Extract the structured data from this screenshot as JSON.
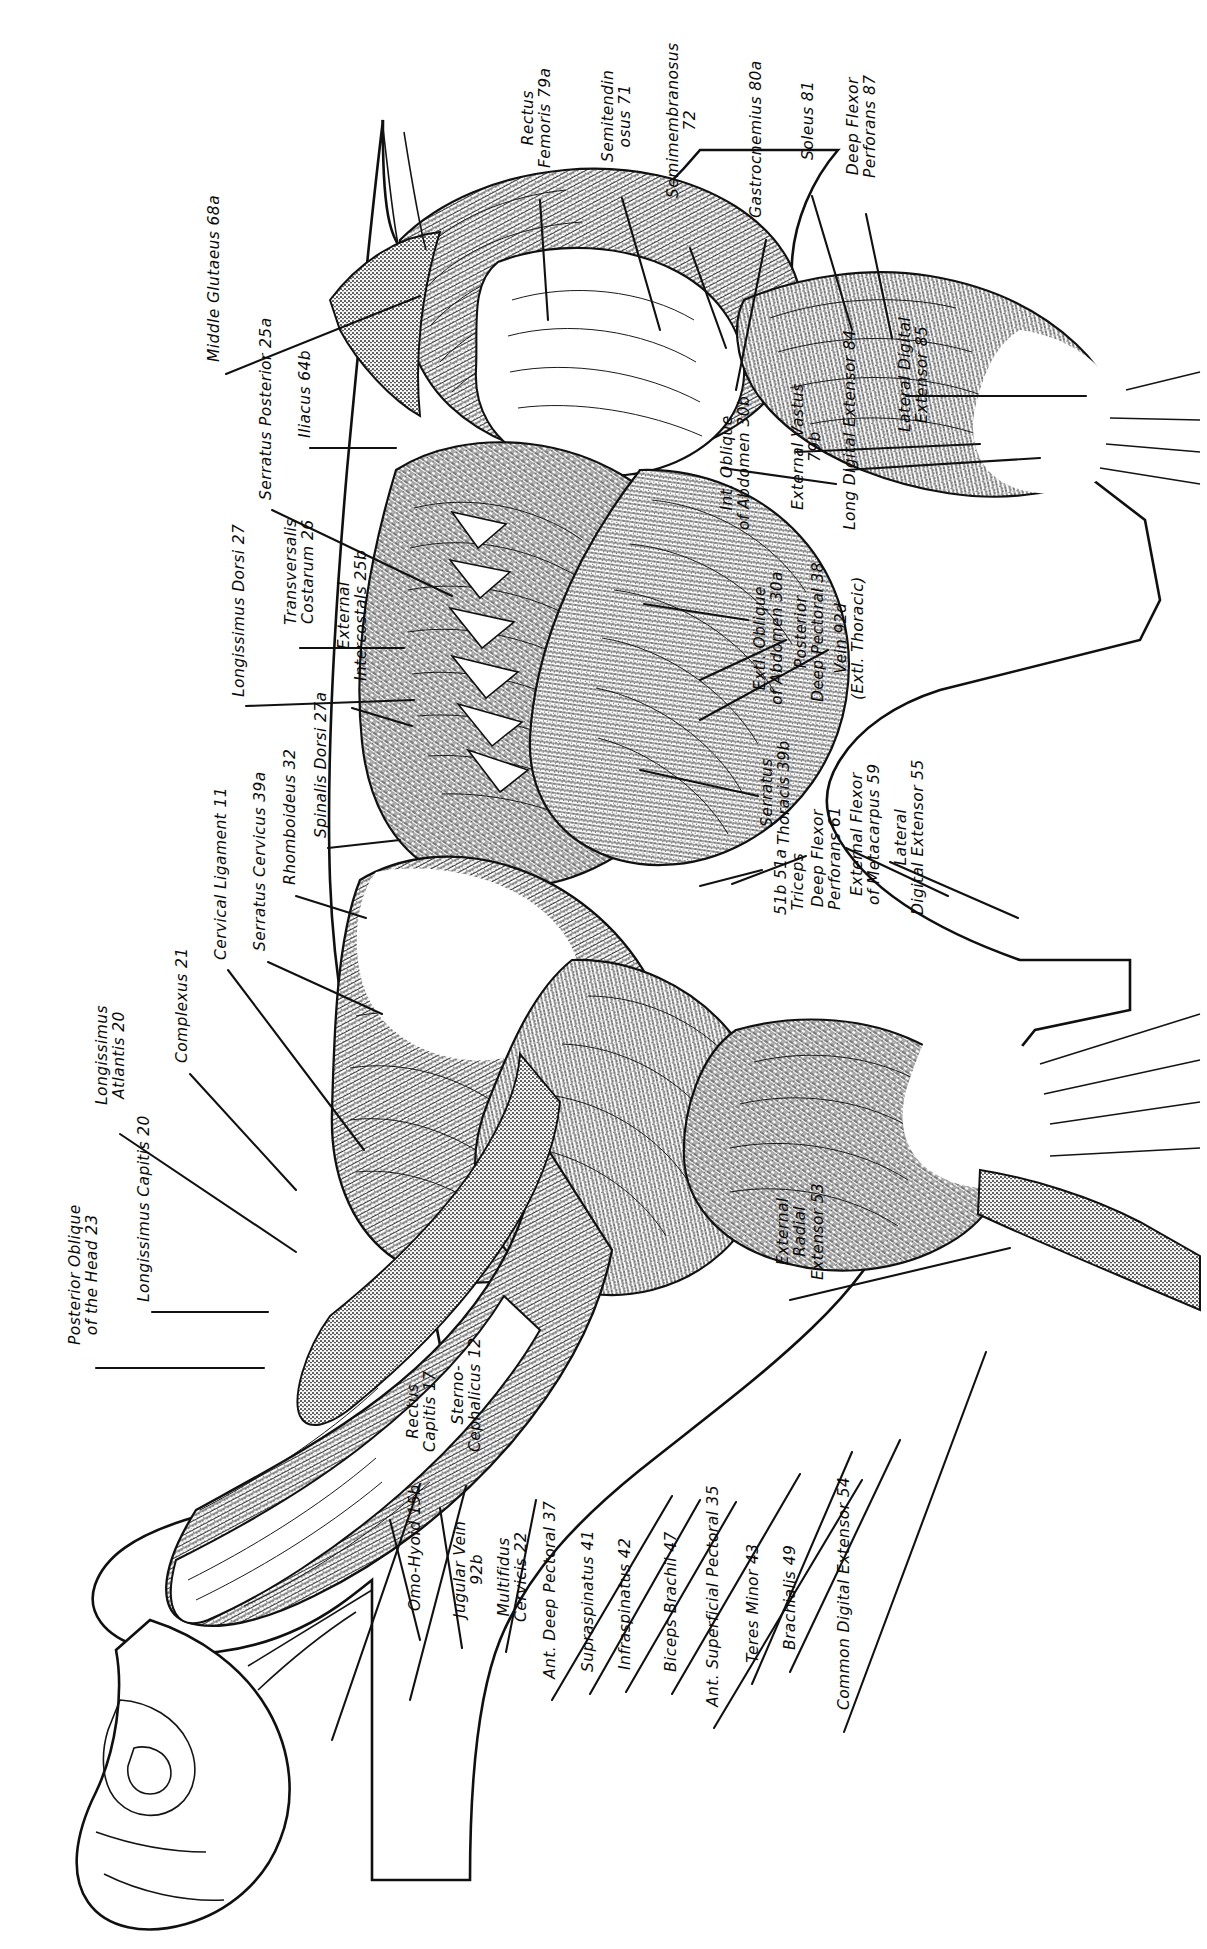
{
  "plate": {
    "kind": "anatomical-illustration",
    "subject": "superficial and deep muscles of the horse, left lateral view",
    "orientation": "labels rotated 90 degrees counter-clockwise",
    "background_color": "#ffffff",
    "ink_color": "#101010"
  },
  "labels": {
    "top_group": [
      {
        "id": "rectus-femoris",
        "line1": "Rectus",
        "line2": "Femoris  79a",
        "x": 520,
        "y": 168,
        "lines": 2
      },
      {
        "id": "semitendinosus",
        "line1": "Semitendin",
        "line2": "osus  71",
        "x": 600,
        "y": 162,
        "lines": 2
      },
      {
        "id": "semimembranosus",
        "line1": "Semimembranosus",
        "line2": "72",
        "x": 665,
        "y": 198,
        "lines": 2
      },
      {
        "id": "gastrocnemius",
        "line1": "Gastrocnemius  80a",
        "line2": "",
        "x": 748,
        "y": 218,
        "lines": 1
      },
      {
        "id": "soleus",
        "line1": "Soleus  81",
        "line2": "",
        "x": 800,
        "y": 160,
        "lines": 1
      },
      {
        "id": "deep-flexor-perforans",
        "line1": "Deep Flexor",
        "line2": "Perforans  87",
        "x": 845,
        "y": 178,
        "lines": 2
      }
    ],
    "right_group": [
      {
        "id": "lateral-digital-extensor-85",
        "line1": "Lateral Digital",
        "line2": "Extensor  85",
        "x": 897,
        "y": 432,
        "lines": 2
      },
      {
        "id": "long-digital-extensor-84",
        "line1": "Long Digital Extensor  84",
        "line2": "",
        "x": 842,
        "y": 530,
        "lines": 1
      },
      {
        "id": "external-vastus-79b",
        "line1": "External Vastus",
        "line2": "79b",
        "x": 790,
        "y": 510,
        "lines": 2
      },
      {
        "id": "int-oblique-abdomen-30b",
        "line1": "Int. Oblique",
        "line2": "of Abdomen  30b",
        "x": 719,
        "y": 530,
        "lines": 2
      },
      {
        "id": "extl-oblique-abdomen-30a",
        "line1": "Extl. Oblique",
        "line2": "of Abdomen  30a",
        "x": 752,
        "y": 705,
        "lines": 2
      },
      {
        "id": "posterior-deep-pectoral-38",
        "line1": "Posterior",
        "line2": "Deep Pectoral  38",
        "x": 793,
        "y": 702,
        "lines": 2
      },
      {
        "id": "vein-92d",
        "line1": "Vein  92d",
        "line2": "(Extl. Thoracic)",
        "x": 833,
        "y": 700,
        "lines": 2
      },
      {
        "id": "serratus-thoracis-39b",
        "line1": "Serratus",
        "line2": "Thoracis  39b",
        "x": 759,
        "y": 845,
        "lines": 2
      },
      {
        "id": "triceps-51b-51a",
        "line1": "51b  51a",
        "line2": "Triceps",
        "x": 773,
        "y": 915,
        "lines": 2
      },
      {
        "id": "deep-flexor-perforans-61",
        "line1": "Deep Flexor",
        "line2": "Perforans  61",
        "x": 810,
        "y": 910,
        "lines": 2
      },
      {
        "id": "external-flexor-metacarpus-59",
        "line1": "External Flexor",
        "line2": "of Metacarpus  59",
        "x": 849,
        "y": 905,
        "lines": 2
      },
      {
        "id": "lateral-digital-extensor-55",
        "line1": "Lateral",
        "line2": "Digital Extensor  55",
        "x": 893,
        "y": 915,
        "lines": 2
      }
    ],
    "left_group": [
      {
        "id": "middle-glutaeus-68a",
        "line1": "Middle Glutaeus  68a",
        "line2": "",
        "x": 206,
        "y": 362,
        "lines": 1
      },
      {
        "id": "serratus-posterior-25a",
        "line1": "Serratus Posterior  25a",
        "line2": "",
        "x": 258,
        "y": 500,
        "lines": 1
      },
      {
        "id": "iliacus-64b",
        "line1": "Iliacus  64b",
        "line2": "",
        "x": 297,
        "y": 438,
        "lines": 1
      },
      {
        "id": "transversalis-costarum-26",
        "line1": "Transversalis",
        "line2": "Costarum  26",
        "x": 283,
        "y": 625,
        "lines": 2
      },
      {
        "id": "longissimus-dorsi-27",
        "line1": "Longissimus Dorsi  27",
        "line2": "",
        "x": 231,
        "y": 697,
        "lines": 1
      },
      {
        "id": "external-intercostals-25b",
        "line1": "External",
        "line2": "Intercostals  25b",
        "x": 336,
        "y": 681,
        "lines": 2
      },
      {
        "id": "spinalis-dorsi-27a",
        "line1": "Spinalis Dorsi  27a",
        "line2": "",
        "x": 313,
        "y": 838,
        "lines": 1
      },
      {
        "id": "rhomboideus-32",
        "line1": "Rhomboideus  32",
        "line2": "",
        "x": 282,
        "y": 885,
        "lines": 1
      },
      {
        "id": "serratus-cervicus-39a",
        "line1": "Serratus Cervicus  39a",
        "line2": "",
        "x": 252,
        "y": 951,
        "lines": 1
      },
      {
        "id": "cervical-ligament-11",
        "line1": "Cervical Ligament  11",
        "line2": "",
        "x": 213,
        "y": 960,
        "lines": 1
      },
      {
        "id": "complexus-21",
        "line1": "Complexus  21",
        "line2": "",
        "x": 174,
        "y": 1063,
        "lines": 1
      },
      {
        "id": "longissimus-atlantis-20",
        "line1": "Longissimus",
        "line2": "Atlantis  20",
        "x": 94,
        "y": 1105,
        "lines": 2
      },
      {
        "id": "longissimus-capitis-20",
        "line1": "Longissimus Capitis  20",
        "line2": "",
        "x": 136,
        "y": 1302,
        "lines": 1
      },
      {
        "id": "posterior-oblique-head-23",
        "line1": "Posterior Oblique",
        "line2": "of the Head  23",
        "x": 67,
        "y": 1345,
        "lines": 2
      }
    ],
    "bottom_group": [
      {
        "id": "rectus-capitis-17",
        "line1": "Rectus",
        "line2": "Capitis  17",
        "x": 405,
        "y": 1452,
        "lines": 2
      },
      {
        "id": "sterno-cephalicus-12",
        "line1": "Sterno-",
        "line2": "Cephalicus  12",
        "x": 450,
        "y": 1452,
        "lines": 2
      },
      {
        "id": "omo-hyoid-15b",
        "line1": "Omo-Hyoid  15b",
        "line2": "",
        "x": 407,
        "y": 1611,
        "lines": 1
      },
      {
        "id": "jugular-vein-92b",
        "line1": "Jugular Vein",
        "line2": "92b",
        "x": 452,
        "y": 1618,
        "lines": 2
      },
      {
        "id": "multifidus-cervicis-22",
        "line1": "Multifidus",
        "line2": "Cervicis  22",
        "x": 496,
        "y": 1622,
        "lines": 2
      },
      {
        "id": "ant-deep-pectoral-37",
        "line1": "Ant. Deep Pectoral  37",
        "line2": "",
        "x": 542,
        "y": 1679,
        "lines": 1
      },
      {
        "id": "supraspinatus-41",
        "line1": "Supraspinatus  41",
        "line2": "",
        "x": 580,
        "y": 1672,
        "lines": 1
      },
      {
        "id": "infraspinatus-42",
        "line1": "Infraspinatus  42",
        "line2": "",
        "x": 617,
        "y": 1670,
        "lines": 1
      },
      {
        "id": "biceps-brachii-47",
        "line1": "Biceps Brachii  47",
        "line2": "",
        "x": 663,
        "y": 1672,
        "lines": 1
      },
      {
        "id": "ant-superficial-pectoral-35",
        "line1": "Ant. Superficial Pectoral  35",
        "line2": "",
        "x": 705,
        "y": 1707,
        "lines": 1
      },
      {
        "id": "teres-minor-43",
        "line1": "Teres Minor  43",
        "line2": "",
        "x": 745,
        "y": 1663,
        "lines": 1
      },
      {
        "id": "brachialis-49",
        "line1": "Brachialis  49",
        "line2": "",
        "x": 782,
        "y": 1650,
        "lines": 1
      },
      {
        "id": "common-digital-extensor-54",
        "line1": "Common Digital Extensor  54",
        "line2": "",
        "x": 836,
        "y": 1710,
        "lines": 1
      },
      {
        "id": "external-radial-extensor-53",
        "line1": "External",
        "line2": "Radial",
        "line3": "Extensor  53",
        "x": 775,
        "y": 1280,
        "lines": 3
      }
    ]
  }
}
